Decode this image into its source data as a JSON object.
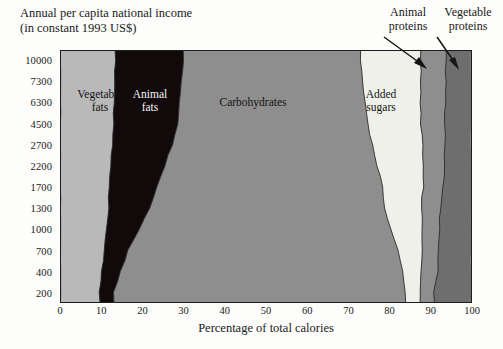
{
  "title": {
    "line1": "Annual per capita national income",
    "line2": "(in constant 1993 US$)"
  },
  "axes": {
    "x_title": "Percentage of total calories",
    "x_ticks": [
      "0",
      "10",
      "20",
      "30",
      "40",
      "50",
      "60",
      "70",
      "80",
      "90",
      "100"
    ],
    "y_ticks": [
      "10000",
      "7300",
      "6300",
      "4500",
      "2700",
      "2200",
      "1700",
      "1300",
      "1000",
      "700",
      "400",
      "200"
    ]
  },
  "band_labels": {
    "vegetable_fats": {
      "l1": "Vegetable",
      "l2": "fats"
    },
    "animal_fats": {
      "l1": "Animal",
      "l2": "fats"
    },
    "carbohydrates": {
      "l1": "Carbohydrates",
      "l2": ""
    },
    "added_sugars": {
      "l1": "Added",
      "l2": "sugars"
    }
  },
  "callouts": {
    "animal_proteins": {
      "l1": "Animal",
      "l2": "proteins"
    },
    "vegetable_proteins": {
      "l1": "Vegetable",
      "l2": "proteins"
    }
  },
  "colors": {
    "vegetable_fats": "#b9b9b9",
    "animal_fats": "#120a0a",
    "carbohydrates": "#8e8e8e",
    "added_sugars": "#f0f0ea",
    "animal_proteins": "#8e8e8e",
    "vegetable_proteins": "#6e6e6e",
    "frame": "#1c1c1c",
    "background": "#fdfdfb"
  },
  "chart_data": {
    "type": "area",
    "title": "Annual per capita national income (in constant 1993 US$)",
    "xlabel": "Percentage of total calories",
    "ylabel": "Annual per capita national income (in constant 1993 US$)",
    "xlim": [
      0,
      100
    ],
    "grid": false,
    "legend": "in-plot band labels",
    "orientation": "horizontal stacked bands; y axis is an ordinal income ladder",
    "y_categories": [
      "200",
      "400",
      "700",
      "1000",
      "1300",
      "1700",
      "2200",
      "2700",
      "4500",
      "6300",
      "7300",
      "10000"
    ],
    "note": "Each row is a national income level; bands show the share of total calories from each source, cumulative left to right to 100%.",
    "series": [
      {
        "name": "Vegetable fats",
        "color": "#b9b9b9",
        "values": [
          9.5,
          10.0,
          10.5,
          11.0,
          11.5,
          11.8,
          12.2,
          12.6,
          12.8,
          13.0,
          13.1,
          13.2
        ]
      },
      {
        "name": "Animal fats",
        "color": "#120a0a",
        "values": [
          3.5,
          4.5,
          6.0,
          8.0,
          10.0,
          11.5,
          13.0,
          14.5,
          15.5,
          16.0,
          16.3,
          16.5
        ]
      },
      {
        "name": "Carbohydrates",
        "color": "#8e8e8e",
        "values": [
          71.0,
          69.0,
          65.5,
          61.5,
          57.5,
          55.0,
          52.0,
          49.0,
          46.5,
          45.0,
          44.2,
          43.5
        ]
      },
      {
        "name": "Added sugars",
        "color": "#f0f0ea",
        "values": [
          3.5,
          4.5,
          6.0,
          7.5,
          9.0,
          10.0,
          11.0,
          12.0,
          13.0,
          13.8,
          14.2,
          14.5
        ]
      },
      {
        "name": "Animal proteins",
        "color": "#8e8e8e",
        "values": [
          3.5,
          3.8,
          4.0,
          4.3,
          4.6,
          4.9,
          5.2,
          5.5,
          5.8,
          6.0,
          6.1,
          6.2
        ]
      },
      {
        "name": "Vegetable proteins",
        "color": "#6e6e6e",
        "values": [
          9.0,
          8.2,
          8.0,
          7.7,
          7.4,
          6.8,
          6.6,
          6.4,
          6.4,
          6.2,
          6.1,
          6.1
        ]
      }
    ],
    "boundaries_cumulative_percent": {
      "note": "Cumulative right-edge of each band, bottom row (200) to top row (10000).",
      "rows": [
        "200",
        "400",
        "700",
        "1000",
        "1300",
        "1700",
        "2200",
        "2700",
        "4500",
        "6300",
        "7300",
        "10000"
      ],
      "vegetable_fats": [
        9.5,
        10.0,
        10.5,
        11.0,
        11.5,
        11.8,
        12.2,
        12.6,
        12.8,
        13.0,
        13.1,
        13.2
      ],
      "animal_fats": [
        13.0,
        14.5,
        16.5,
        19.0,
        21.5,
        23.3,
        25.2,
        27.1,
        28.3,
        29.0,
        29.4,
        29.7
      ],
      "carbohydrates": [
        84.0,
        83.5,
        82.0,
        80.5,
        79.0,
        78.3,
        77.2,
        76.1,
        74.8,
        74.0,
        73.6,
        73.2
      ],
      "added_sugars": [
        87.5,
        88.0,
        88.0,
        88.0,
        88.0,
        88.3,
        88.2,
        88.1,
        87.8,
        87.8,
        87.8,
        87.7
      ],
      "animal_proteins": [
        91.0,
        91.8,
        92.0,
        92.3,
        92.6,
        93.2,
        93.4,
        93.6,
        93.6,
        93.8,
        93.9,
        93.9
      ],
      "vegetable_proteins": [
        100,
        100,
        100,
        100,
        100,
        100,
        100,
        100,
        100,
        100,
        100,
        100
      ]
    }
  }
}
